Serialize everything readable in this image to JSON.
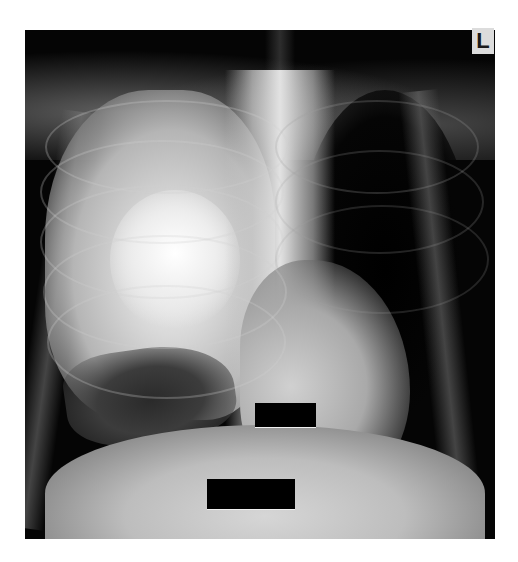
{
  "image": {
    "description": "Frontal chest radiograph",
    "background_color": "#ffffff",
    "film_color": "#050505"
  },
  "marker": {
    "label": "L"
  },
  "redactions": [
    {
      "name": "upper-redaction-box",
      "left": 255,
      "top": 403,
      "width": 61,
      "height": 24,
      "color": "#000000"
    },
    {
      "name": "lower-redaction-box",
      "left": 207,
      "top": 479,
      "width": 88,
      "height": 30,
      "color": "#000000"
    }
  ]
}
